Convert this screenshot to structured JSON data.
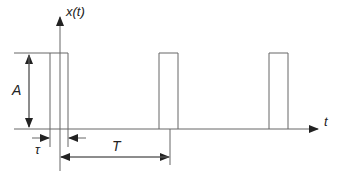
{
  "diagram": {
    "y_axis_label": "x(t)",
    "x_axis_label": "t",
    "amplitude_label": "A",
    "pulse_width_label": "τ",
    "period_label": "T",
    "pulse_count": 3,
    "line_color": "#555555"
  }
}
